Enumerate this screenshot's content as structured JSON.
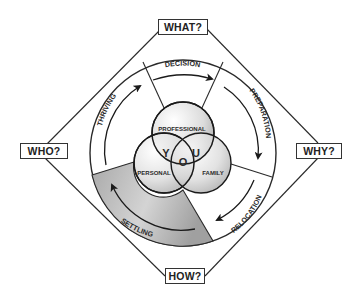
{
  "corners": {
    "top": "WHAT?",
    "left": "WHO?",
    "right": "WHY?",
    "bottom": "HOW?"
  },
  "stages": [
    {
      "id": "decision",
      "label": "DECISION"
    },
    {
      "id": "preparation",
      "label": "PREPARATION"
    },
    {
      "id": "relocation",
      "label": "RELOCATION"
    },
    {
      "id": "settling",
      "label": "SETTLING",
      "highlighted": true
    },
    {
      "id": "thriving",
      "label": "THRIVING"
    }
  ],
  "venn": {
    "circles": [
      {
        "id": "professional",
        "label": "PROFESSIONAL"
      },
      {
        "id": "personal",
        "label": "PERSONAL"
      },
      {
        "id": "family",
        "label": "FAMILY"
      }
    ],
    "center_letters": [
      "Y",
      "O",
      "U"
    ]
  },
  "colors": {
    "line": "#2a2a2a",
    "highlight_fill": "#b5b5b5",
    "background": "#ffffff"
  }
}
